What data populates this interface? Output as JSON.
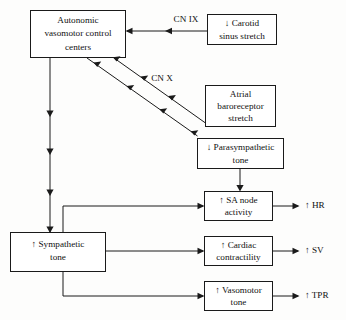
{
  "diagram": {
    "colors": {
      "background": "#fdfdfc",
      "line": "#1a1a1a",
      "box_fill": "#ffffff",
      "text": "#111111"
    },
    "nodes": {
      "control_centers": {
        "line1": "Autonomic",
        "line2": "vasomotor control",
        "line3": "centers"
      },
      "carotid": {
        "line1": "↓ Carotid",
        "line2": "sinus stretch"
      },
      "atrial": {
        "line1": "Atrial",
        "line2": "baroreceptor",
        "line3": "stretch"
      },
      "parasympathetic": {
        "line1": "↓ Parasympathetic",
        "line2": "tone"
      },
      "sa_node": {
        "line1": "↑ SA node",
        "line2": "activity"
      },
      "sympathetic": {
        "line1": "↑ Sympathetic",
        "line2": "tone"
      },
      "cardiac": {
        "line1": "↑ Cardiac",
        "line2": "contractility"
      },
      "vasomotor": {
        "line1": "↑ Vasomotor",
        "line2": "tone"
      }
    },
    "edge_labels": {
      "cn9": "CN IX",
      "cn10": "CN X"
    },
    "outputs": {
      "hr": "↑ HR",
      "sv": "↑ SV",
      "tpr": "↑ TPR"
    }
  }
}
